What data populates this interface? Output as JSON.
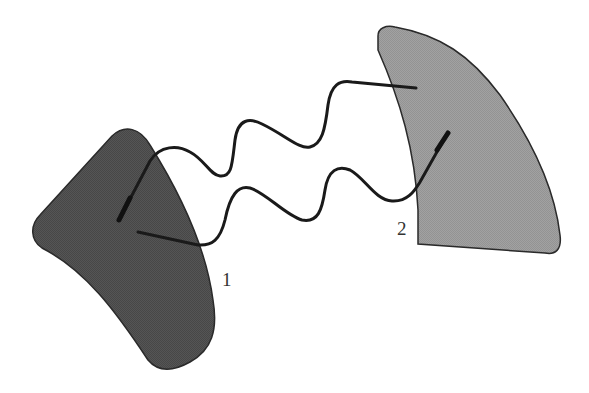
{
  "diagram": {
    "type": "two bodies connected by two wavy lines",
    "bodies": [
      {
        "id": "body-1",
        "label": "1",
        "fill": "#4f4f4f",
        "stroke": "#2a2a2a"
      },
      {
        "id": "body-2",
        "label": "2",
        "fill": "#9c9c9c",
        "stroke": "#2a2a2a"
      }
    ],
    "connectors": [
      {
        "id": "wavy-line-upper",
        "from": "body-1",
        "to": "body-2",
        "color": "#1a1a1a"
      },
      {
        "id": "wavy-line-lower",
        "from": "body-1",
        "to": "body-2",
        "color": "#1a1a1a"
      }
    ]
  }
}
